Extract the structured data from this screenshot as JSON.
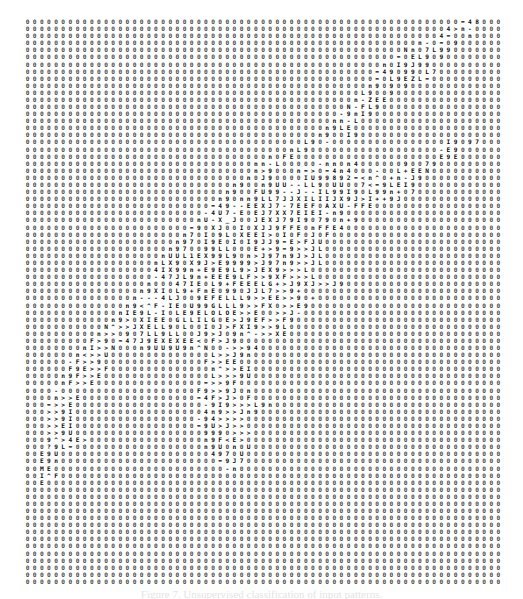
{
  "figure": {
    "type": "glyph-matrix",
    "columns": 67,
    "rows": 80,
    "cell_width_px": 7.09,
    "cell_height_px": 7.09,
    "grid_left_px": 24,
    "grid_top_px": 18,
    "background_glyph": "0",
    "glyph_color": "#0d0d0d",
    "background_glyph_color": "#4a4a4a",
    "page_color": "#ffffff",
    "foreground_alphabet": "0123456789ABCDEFGHIJKLMNOPQRSTUVWXYZ<>^~-=_[]{}()/\\|+*",
    "caption": "Figure 7. Unsupervised classification of input patterns."
  },
  "chart_data": {
    "type": "heatmap",
    "title": "",
    "xlabel": "",
    "ylabel": "",
    "grid": false,
    "legend": "none",
    "ncols": 67,
    "nrows": 80,
    "background_symbol": "0",
    "note": "Each matrix cell is a printed character. Rows below are given as strings of length 67; '0' denotes the default filler glyph and all other characters denote distinct labelled units.",
    "rows": [
      "0000000000000000000000000000000000000000000000000000000000000=4800",
      "000000000000000000000000000000000000000000000000000000000004>n-00",
      "00000000000000000000000000000000000000000000000000000000004=00n00",
      "0000000000000000000000000000000000000000000000000000000n-0=09000",
      "00000000000000000000000000000000000000000000000000000Nn07L9900000",
      "0000000000000000000000000000000000000000000000000000=0EL90900000",
      "00000000000000000000000000000000000000000000000000n0I9J990000000",
      "0000000000000000000000000000000000000000000000000=490990L7000000",
      "0000000000000000000000000000000000000000000000000=0L9EZL=000000",
      "000000000000000000000000000000000000000000000000n90909000000000",
      "00000000000000000000000000000000000000000000000L90090000000000",
      "0000000000000000000000000000000000000000000000n-ZEE000000000000",
      "000000000000000000000000000000000000000000000N-FL900000000000000",
      "00000000000000000000000000000000000000000000-9nI90000000000000",
      "0000000000000000000000000000000000000000000nn-L0000000000000000",
      "000000000000000000000000000000000000000000n9LE0000000000000000",
      "00000000000000000000000000000000000000000n900I900000000000000000",
      "000000000000000000000000000000000000000L90-0000000000000000I9097",
      "0000000000000000000000000000000000000nL9000000000000000000-E90",
      "0000000000000000000000000000000000n0FE00000000000000000000E9E",
      "00000000000000000000000000000000nn-L00000-nn0n400000090079000",
      "00000000000000000000000000000000n>9000n=>0=4n4000-00L+EEN00000",
      "0000000000000000000000000000000n0J90000IU99892=<n^0+n-J9000000",
      "00000000000000000000000000000n900n9UU--LL90UU007<=9LEI900000",
      "0000000000000000000000000000n900FU99--J--IL99I90L99n+070000",
      "000000000000000000000000000n90nn9LL7JJXILIIJX9J>I++9J00000",
      "00000000000000000000000000=49--EEXJ7-7EEF0AXU-FFE000000",
      "0000000000000000000000000-4U7-E0EJ7XX7EIEI-n900000000",
      "000000000000000000000000nU-X_J00JEXJ79I90790n+9000000",
      "00000000000000000000000=90XJ00I0XJJ9FFE0nFFE400000000",
      "0000000000000000000000n70I09L0XEEI>0I0F0J0F000000000",
      "000000000000000000000n970I9E0I0I9JJ9=E>FJU000000000",
      "00000000000000000000n970099LL000E+>9=9>>JL0000000000",
      "0000000000000000000nUUL1EX99L90n>J97n9J>JL00000000",
      "000000000000000000nLX90X9J>E9999>J97n9>>JL0000000",
      "0000000000000000004IX99n+E9E9L9>JEX9>>>L000000000",
      "000000000000000000-47JL9n+EEE9LF>>9XF>>>L0000000",
      "00000000000000000n00047IE0L9+FEEELG+>J9XJ>>J900000",
      "0000000000000000n9XI0L9+FnE0990JJL7>>9+00000000",
      "000000000000000n---4LJ009EFELLL9>>EE>>90+00000000",
      "00000000000000n9<^F-IE0U99GLLL9>>FX0>>E900000000",
      "0000000000000nIE9L-I0LE9ELOLOE>>E00>>J-000000000",
      "000000000000n9>0XIEE0GLLILG0E>J9EF>>F900000000",
      "00000000000N^>>JXELL90L00I0J>FXI9>>9L000000000",
      "0000000000n>>09 7LL9LL00J9>J09n^->>XE0000000",
      "000000000F>90=47J9EXEXEE<0F>J90000000000",
      "00000000nI>>N000n9UU9U9n^N00->>94000000000",
      "0000000n<>>U00000000000000L>>J9n0000000000",
      "000000-F>>900000000000000F>>EE0000000000",
      "000000F9E>>F00000000000000n^>>EI000000000",
      "00000n9F>>E000000000000000L>>>9U00000000",
      "00000nF>>E000000000000000=>>9F0000000000",
      "0000-0000000000000000000F9>>9J0n00000000",
      "0000n>>E0000000000000000=4F>J>0F0000000",
      "000=>>E000000000000000000-9I9>>>L9n00000",
      "000>>9I0000000000000000004n9>>Jn900000",
      "000>>9I00000000000000000-94>>>>000000",
      "000>>EI00000000000000000=9U>J>>00000",
      "000>>9U0000000000000000009990>>>00000",
      "0009^>4E>0000000000000000n9F<E>00000",
      "000?9L=000000000000000000n9U0n0U00000",
      "00E9U0000000000000000000004970U00000",
      "00E9n0000000000000000000000=9J700000",
      "00ME000000000000000000000000-n000000",
      "00I^F000000000000000000000000000000",
      "00E00000000000000000000000000000000",
      "000000000000000000000000000000000000",
      "0000000000000000000000000000000000000",
      "00000000000000000000000000000000000000",
      "000000000000000000000000000000000000000",
      "0000000000000000000000000000000000000000",
      "00000000000000000000000000000000000000000",
      "000000000000000000000000000000000000000000",
      "0000000000000000000000000000000000000000000",
      "00000000000000000000000000000000000000000000",
      "000000000000000000000000000000000000000000000",
      "0000000000000000000000000000000000000000000000",
      "00000000000000000000000000000000000000000000000",
      "000000000000000000000000000000000000000000000000",
      "0000000000000000000000000000000000000000000000000"
    ]
  }
}
